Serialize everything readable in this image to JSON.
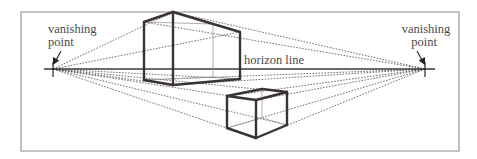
{
  "diagram": {
    "labels": {
      "left_vp_line1": "vanishing",
      "left_vp_line2": "point",
      "right_vp_line1": "vanishing",
      "right_vp_line2": "point",
      "horizon": "horizon line"
    },
    "colors": {
      "frame": "#9a9a9a",
      "edges": "#3b3236",
      "guides": "#333333",
      "text": "#4a4a4a",
      "background": "#ffffff"
    },
    "vanishing_points": {
      "left": [
        53,
        69
      ],
      "right": [
        425,
        69
      ]
    },
    "boxes": [
      {
        "name": "upper-box",
        "position": "straddling horizon",
        "corners": {
          "front_top": [
            173,
            12
          ],
          "front_bottom": [
            173,
            85
          ],
          "left_top": [
            144,
            22
          ],
          "left_bottom": [
            144,
            80
          ],
          "right_top": [
            240,
            32
          ],
          "right_bottom": [
            240,
            79
          ],
          "back_top": [
            213,
            24
          ],
          "back_bottom": [
            213,
            77
          ]
        }
      },
      {
        "name": "lower-box",
        "position": "below horizon",
        "corners": {
          "front_top": [
            256,
            100
          ],
          "front_bottom": [
            256,
            138
          ],
          "left_top": [
            227,
            96
          ],
          "left_bottom": [
            227,
            128
          ],
          "right_top": [
            287,
            92
          ],
          "right_bottom": [
            287,
            125
          ],
          "back_top": [
            262,
            89
          ],
          "back_bottom": [
            262,
            118
          ]
        }
      }
    ]
  }
}
